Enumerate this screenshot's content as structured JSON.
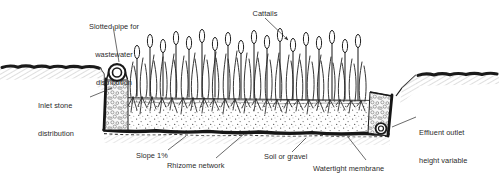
{
  "diagram": {
    "background_color": "#ffffff",
    "ink_color": "#1a1a1a",
    "labels": {
      "slotted_pipe": "Slotted pipe for\nwastewater\ndistribution",
      "slotted_pipe_line1": "Slotted pipe for",
      "slotted_pipe_line2": "wastewater",
      "slotted_pipe_line3": "distribution",
      "cattails": "Cattails",
      "inlet_stone_line1": "Inlet stone",
      "inlet_stone_line2": "distribution",
      "effluent_outlet_line1": "Effluent outlet",
      "effluent_outlet_line2": "height variable",
      "slope": "Slope 1%",
      "rhizome_network": "Rhizome network",
      "soil_or_gravel": "Soil or gravel",
      "watertight_membrane": "Watertight membrane"
    },
    "components": [
      {
        "name": "slotted-distribution-pipe",
        "kind": "pipe-circle"
      },
      {
        "name": "inlet-stone-zone",
        "kind": "stone-fill"
      },
      {
        "name": "cattail-vegetation",
        "kind": "plants"
      },
      {
        "name": "rhizome-root-zone",
        "kind": "roots"
      },
      {
        "name": "soil-gravel-bed",
        "kind": "stipple-fill"
      },
      {
        "name": "watertight-membrane",
        "kind": "dark-band"
      },
      {
        "name": "effluent-outlet-pipe",
        "kind": "pipe-circle"
      },
      {
        "name": "outlet-stone-zone",
        "kind": "stone-fill"
      },
      {
        "name": "ground-surface",
        "kind": "ground-line"
      }
    ]
  }
}
